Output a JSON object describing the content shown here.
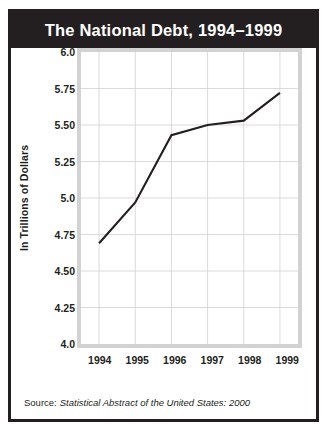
{
  "chart_data": {
    "type": "line",
    "title": "The National Debt, 1994–1999",
    "xlabel": "",
    "ylabel": "In Trillions of Dollars",
    "categories": [
      "1994",
      "1995",
      "1996",
      "1997",
      "1998",
      "1999"
    ],
    "values": [
      4.69,
      4.97,
      5.43,
      5.5,
      5.53,
      5.72
    ],
    "series": [
      {
        "name": "National Debt",
        "values": [
          4.69,
          4.97,
          5.43,
          5.5,
          5.53,
          5.72
        ]
      }
    ],
    "ylim": [
      4.0,
      6.0
    ],
    "ytick_labels": [
      "6.0",
      "5.75",
      "5.50",
      "5.25",
      "5.0",
      "4.75",
      "4.50",
      "4.25",
      "4.0"
    ],
    "ytick_values": [
      6.0,
      5.75,
      5.5,
      5.25,
      5.0,
      4.75,
      4.5,
      4.25,
      4.0
    ],
    "grid": true,
    "legend": "none",
    "line_color": "#231f20",
    "grid_color": "#d9d9d9",
    "plot_background": "#ffffff",
    "title_background": "#231f20",
    "title_color": "#ffffff"
  },
  "source": {
    "prefix": "Source:",
    "title": "Statistical Abstract of the United States: 2000"
  }
}
